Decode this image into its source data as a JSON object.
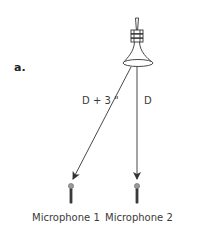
{
  "figure": {
    "panel_label": "a.",
    "source": {
      "name": "loudspeaker",
      "icon": "horn-speaker-icon"
    },
    "paths": [
      {
        "label": "D + 3 \"",
        "target": "Microphone 1"
      },
      {
        "label": "D",
        "target": "Microphone 2"
      }
    ],
    "microphones": [
      {
        "label": "Microphone 1",
        "icon": "microphone-icon"
      },
      {
        "label": "Microphone 2",
        "icon": "microphone-icon"
      }
    ],
    "colors": {
      "line": "#333333",
      "mic_body": "#3a3a3a",
      "mic_head": "#9a9a9a",
      "background": "#ffffff"
    }
  }
}
